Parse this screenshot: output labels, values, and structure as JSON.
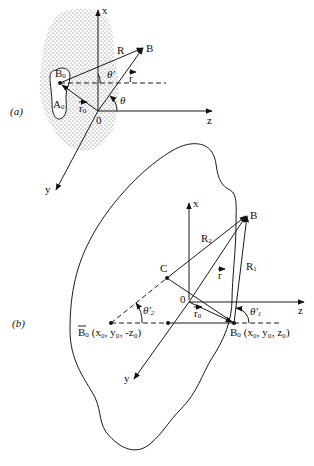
{
  "figure": {
    "panel_a": {
      "label": "(a)",
      "axes": {
        "x": "x",
        "y": "y",
        "z": "z"
      },
      "origin": "0",
      "points": {
        "B": "B",
        "B0": "B",
        "B0_sub": "0",
        "A0": "A",
        "A0_sub": "0"
      },
      "vectors": {
        "R": "R",
        "r": "r",
        "r0": "r",
        "r0_sub": "0"
      },
      "angles": {
        "theta": "θ",
        "theta_prime": "θ′"
      }
    },
    "panel_b": {
      "label": "(b)",
      "axes": {
        "x": "x",
        "y": "y",
        "z": "z"
      },
      "origin": "0",
      "points": {
        "B": "B",
        "C": "C",
        "B0": "B",
        "B0_sub": "0",
        "B0_coords": "(x₀, y₀, z₀)",
        "B0_tilde": "B",
        "B0_tilde_sub": "0",
        "B0_tilde_coords": "(x₀, y₀, -z₀)"
      },
      "vectors": {
        "R1": "R",
        "R1_sub": "1",
        "R2": "R",
        "R2_sub": "2",
        "r": "r",
        "r0": "r",
        "r0_sub": "0"
      },
      "angles": {
        "theta1_prime": "θ′",
        "theta1_sub": "1",
        "theta2_prime": "θ′",
        "theta2_sub": "2"
      }
    }
  }
}
